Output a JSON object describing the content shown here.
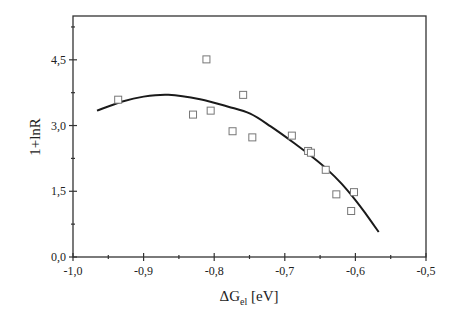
{
  "chart_data": {
    "type": "scatter",
    "title": "",
    "xlabel": "ΔG",
    "xlabel_sub": "el",
    "xlabel_unit": " [eV]",
    "ylabel": "1+lnR",
    "xlim": [
      -1.0,
      -0.5
    ],
    "ylim": [
      0.0,
      5.5
    ],
    "grid": false,
    "legend": null,
    "x_ticks": [
      -1.0,
      -0.9,
      -0.8,
      -0.7,
      -0.6,
      -0.5
    ],
    "x_tick_labels": [
      "-1,0",
      "-0,9",
      "-0,8",
      "-0,7",
      "-0,6",
      "-0,5"
    ],
    "x_minor_ticks": [
      -0.95,
      -0.85,
      -0.75,
      -0.65,
      -0.55
    ],
    "y_ticks": [
      0.0,
      1.5,
      3.0,
      4.5
    ],
    "y_tick_labels": [
      "0,0",
      "1,5",
      "3,0",
      "4,5"
    ],
    "y_minor_ticks": [
      0.75,
      2.25,
      3.75,
      5.25
    ],
    "series": [
      {
        "name": "data",
        "type": "scatter",
        "marker": "open-square",
        "x": [
          -0.936,
          -0.83,
          -0.811,
          -0.805,
          -0.774,
          -0.759,
          -0.746,
          -0.69,
          -0.667,
          -0.663,
          -0.642,
          -0.627,
          -0.606,
          -0.602
        ],
        "y": [
          3.59,
          3.25,
          4.51,
          3.34,
          2.87,
          3.7,
          2.73,
          2.77,
          2.42,
          2.38,
          1.99,
          1.43,
          1.05,
          1.48
        ]
      },
      {
        "name": "fit",
        "type": "line",
        "x": [
          -0.966,
          -0.93,
          -0.9,
          -0.865,
          -0.82,
          -0.78,
          -0.749,
          -0.72,
          -0.686,
          -0.66,
          -0.64,
          -0.62,
          -0.6,
          -0.585,
          -0.567
        ],
        "y": [
          3.34,
          3.55,
          3.66,
          3.7,
          3.6,
          3.43,
          3.27,
          2.98,
          2.59,
          2.27,
          2.0,
          1.68,
          1.3,
          0.98,
          0.57
        ]
      }
    ]
  }
}
